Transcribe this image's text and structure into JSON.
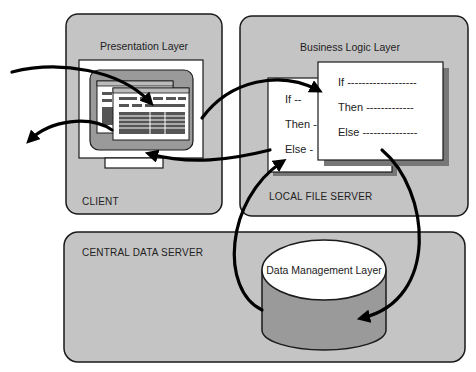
{
  "diagram": {
    "client": {
      "layer_label": "Presentation Layer",
      "caption": "CLIENT"
    },
    "local_file_server": {
      "layer_label": "Business Logic Layer",
      "caption": "LOCAL FILE SERVER",
      "back_card": [
        "If --",
        "Then -",
        "Else -"
      ],
      "front_card": [
        "If -------------------",
        "Then -------------",
        "Else ---------------"
      ]
    },
    "central_data_server": {
      "caption": "CENTRAL DATA SERVER",
      "database_label": "Data Management Layer"
    },
    "colors": {
      "panel_gray": "#c4c4c4",
      "db_side": "#9a9a9a",
      "outline": "#1a1a1a",
      "arrow": "#000000",
      "card_white": "#ffffff"
    }
  }
}
